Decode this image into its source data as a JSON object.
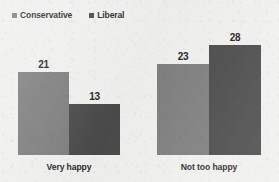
{
  "chart_data": {
    "type": "bar",
    "title": "",
    "subtitle": "",
    "xlabel": "",
    "ylabel": "",
    "grid": false,
    "legend_position": "top-left",
    "orientation": "vertical",
    "grouping": "grouped",
    "value_labels": true,
    "axis_visible": false,
    "ylim": [
      0,
      33
    ],
    "categories": [
      "Very happy",
      "Not too happy"
    ],
    "series": [
      {
        "name": "Conservative",
        "color": "#7f7f7f",
        "values": [
          21,
          23
        ],
        "value_labels": [
          "21",
          "23"
        ]
      },
      {
        "name": "Liberal",
        "color": "#4a4a4a",
        "values": [
          13,
          28
        ],
        "value_labels": [
          "13",
          "28"
        ]
      }
    ]
  },
  "legend": {
    "entries": [
      {
        "label": "Conservative",
        "swatch_color": "#7f7f7f"
      },
      {
        "label": "Liberal",
        "swatch_color": "#4a4a4a"
      }
    ]
  },
  "colors": {
    "background": "#f1f1ef",
    "conservative": "#7f7f7f",
    "liberal": "#4a4a4a",
    "text": "#2b2b2b",
    "value_text": "#232323"
  }
}
